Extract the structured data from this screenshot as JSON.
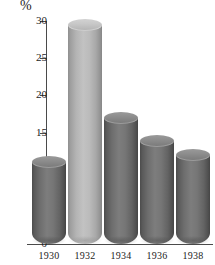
{
  "chart_data": {
    "type": "bar",
    "title": "",
    "subtitle": "",
    "xlabel": "",
    "ylabel": "%",
    "unit_label": "%",
    "categories": [
      "1930",
      "1932",
      "1934",
      "1936",
      "1938"
    ],
    "values": [
      11,
      29.5,
      17,
      13.8,
      12
    ],
    "series": [
      {
        "name": "",
        "values": [
          11,
          29.5,
          17,
          13.8,
          12
        ]
      }
    ],
    "ylim": [
      0,
      30
    ],
    "y_ticks": [
      0,
      5,
      10,
      15,
      20,
      25,
      30
    ],
    "y_tick_labels": [
      "0",
      "5",
      "10",
      "15",
      "20",
      "25",
      "30"
    ],
    "x_tick_labels": [
      "1930",
      "1932",
      "1934",
      "1936",
      "1938"
    ],
    "grid": false,
    "legend": false,
    "legend_position": "none",
    "annotations": [],
    "bar_style": "3d-cylinder",
    "highlighted_category": "1932",
    "colors": {
      "background": "#ffffff",
      "axis": "#4a4a4a",
      "text": "#1c1c1c",
      "bar_dark": "#6e6e6e",
      "bar_dark_top": "#8d8d8d",
      "bar_light": "#b4b4b4",
      "bar_light_top": "#c8c8c8"
    },
    "bars": [
      {
        "category": "1930",
        "value": 11,
        "shade": "dark"
      },
      {
        "category": "1932",
        "value": 29.5,
        "shade": "light"
      },
      {
        "category": "1934",
        "value": 17,
        "shade": "dark"
      },
      {
        "category": "1936",
        "value": 13.8,
        "shade": "dark"
      },
      {
        "category": "1938",
        "value": 12,
        "shade": "dark"
      }
    ]
  }
}
